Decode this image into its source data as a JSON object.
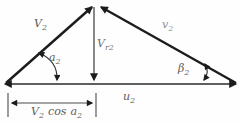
{
  "diagram_type": "velocity-triangle",
  "labels": {
    "absolute_velocity": {
      "main": "V",
      "sub": "2"
    },
    "relative_velocity": {
      "main": "v",
      "sub": "2"
    },
    "radial_component": {
      "main": "V",
      "sub": "r2"
    },
    "blade_velocity": {
      "main": "u",
      "sub": "2"
    },
    "alpha_angle": {
      "main": "a",
      "sub": "2"
    },
    "beta_angle": {
      "main": "β",
      "sub": "2"
    },
    "dimension": {
      "v_main": "V",
      "v_sub": "2",
      "operator": "cos",
      "a_main": "a",
      "a_sub": "2"
    }
  },
  "colors": {
    "line": "#1c1c1c",
    "text": "#5c5c5c",
    "background": "#fefefe"
  }
}
